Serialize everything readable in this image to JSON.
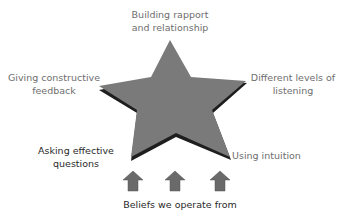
{
  "diagram": {
    "center_shape": "five-point-star",
    "colors": {
      "star_fill": "#7a7a7a",
      "star_shadow": "#1e1e1e",
      "arrow_fill": "#6a6a6a",
      "label_light": "#6e6e6e",
      "label_dark": "#2a2a2a"
    },
    "points": {
      "top": "Building rapport\nand relationship",
      "left": "Giving constructive\nfeedback",
      "right": "Different levels of\nlistening",
      "bottom_left": "Asking effective\nquestions",
      "bottom_right": "Using intuition"
    },
    "labels": {
      "top_line1": "Building rapport",
      "top_line2": "and relationship",
      "left_line1": "Giving constructive",
      "left_line2": "feedback",
      "right_line1": "Different levels of",
      "right_line2": "listening",
      "bottom_left_line1": "Asking effective",
      "bottom_left_line2": "questions",
      "bottom_right_line1": "Using intuition"
    },
    "base": {
      "label": "Beliefs we operate from",
      "arrow_count": 3,
      "arrow_icon": "up-arrow-icon"
    }
  }
}
